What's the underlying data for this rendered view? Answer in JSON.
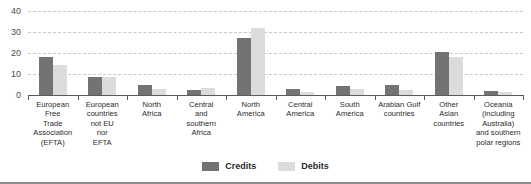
{
  "chart_data": {
    "type": "bar",
    "title": "",
    "subtitle": "",
    "xlabel": "",
    "ylabel": "",
    "ylim": [
      0,
      40
    ],
    "yticks": [
      0,
      10,
      20,
      30,
      40
    ],
    "grid": true,
    "legend_position": "bottom",
    "categories": [
      "European\nFree\nTrade\nAssociation\n(EFTA)",
      "European\ncountries\nnot EU\nnor\nEFTA",
      "North\nAfrica",
      "Central\nand\nsouthern\nAfrica",
      "North\nAmerica",
      "Central\nAmerica",
      "South\nAmerica",
      "Arabian Gulf\ncountries",
      "Other\nAsian\ncountries",
      "Oceania\n(including\nAustralia)\nand southern\npolar regions"
    ],
    "series": [
      {
        "name": "Credits",
        "color": "#737373",
        "values": [
          18,
          8.5,
          5,
          2.5,
          27,
          3,
          4.5,
          5,
          20.5,
          2
        ]
      },
      {
        "name": "Debits",
        "color": "#dcdcdc",
        "values": [
          14.5,
          8.5,
          3,
          3.5,
          32,
          1.5,
          3,
          2.5,
          18,
          1.5
        ]
      }
    ]
  },
  "legend": {
    "items": [
      {
        "label": "Credits",
        "color": "#737373"
      },
      {
        "label": "Debits",
        "color": "#dcdcdc"
      }
    ]
  },
  "colors": {
    "credits": "#737373",
    "debits": "#dcdcdc",
    "gridline": "#c9c9c9",
    "axis": "#5a5a5a",
    "text": "#2b2b2b",
    "background": "#ffffff"
  }
}
